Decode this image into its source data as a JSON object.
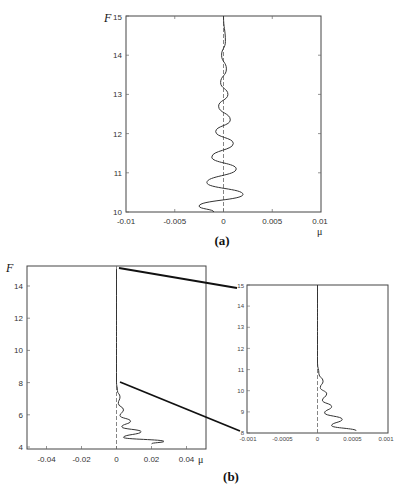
{
  "chart_data": [
    {
      "id": "a",
      "type": "line",
      "panel_label": "(a)",
      "title": "",
      "xlabel": "μ",
      "ylabel": "F",
      "xlim": [
        -0.01,
        0.01
      ],
      "ylim": [
        10,
        15
      ],
      "xticks": [
        -0.01,
        -0.005,
        0,
        0.005,
        0.01
      ],
      "xtick_labels": [
        "-0.01",
        "-0.005",
        "0",
        "0.005",
        "0.01"
      ],
      "yticks": [
        10,
        11,
        12,
        13,
        14,
        15
      ],
      "ytick_labels": [
        "10",
        "11",
        "12",
        "13",
        "14",
        "15"
      ],
      "grid": false,
      "zero_line": "dashed vertical at μ=0",
      "series": [
        {
          "name": "μ(F)",
          "description": "damped oscillation about μ=0, amplitude decaying with increasing F",
          "x": [
            -0.001,
            -0.0025,
            0.002,
            -0.0017,
            0.0013,
            -0.0012,
            0.001,
            -0.0008,
            0.0007,
            -0.0005,
            0.00045,
            -0.0003,
            0.0003,
            -0.0002,
            0.0002,
            0
          ],
          "y": [
            10.0,
            10.15,
            10.45,
            10.75,
            11.1,
            11.4,
            11.75,
            12.05,
            12.35,
            12.7,
            13.0,
            13.3,
            13.65,
            14.0,
            14.35,
            15.0
          ]
        }
      ]
    },
    {
      "id": "b-main",
      "type": "line",
      "panel_label": "(b)",
      "title": "",
      "xlabel": "μ",
      "ylabel": "F",
      "xlim": [
        -0.051,
        0.051
      ],
      "ylim": [
        3.88,
        15.2
      ],
      "xticks": [
        -0.04,
        -0.02,
        0,
        0.02,
        0.04
      ],
      "xtick_labels": [
        "-0.04",
        "-0.02",
        "0",
        "0.02",
        "0.04"
      ],
      "yticks": [
        4,
        6,
        8,
        10,
        12,
        14
      ],
      "ytick_labels": [
        "4",
        "6",
        "8",
        "10",
        "12",
        "14"
      ],
      "grid": false,
      "zero_line": "dashed vertical at μ=0",
      "series": [
        {
          "name": "μ(F)",
          "description": "one-sided decaying oscillation for μ≥0, large near F≈4, near zero above F≈8",
          "x": [
            0.02,
            0.027,
            0.004,
            0.014,
            0.003,
            0.008,
            0.002,
            0.004,
            0.001,
            0.002,
            0.0005,
            0,
            0
          ],
          "y": [
            4.2,
            4.35,
            4.6,
            4.95,
            5.25,
            5.6,
            5.95,
            6.3,
            6.7,
            7.1,
            7.5,
            8.0,
            15.0
          ]
        }
      ]
    },
    {
      "id": "b-inset",
      "type": "line",
      "panel_label": "",
      "title": "",
      "xlabel": "",
      "ylabel": "",
      "xlim": [
        -0.001,
        0.001
      ],
      "ylim": [
        8,
        15
      ],
      "xticks": [
        -0.001,
        -0.0005,
        0,
        0.0005,
        0.001
      ],
      "xtick_labels": [
        "-0.001",
        "-0.0005",
        "0",
        "0.0005",
        "0.001"
      ],
      "yticks": [
        8,
        9,
        10,
        11,
        12,
        13,
        14,
        15
      ],
      "ytick_labels": [
        "8",
        "9",
        "10",
        "11",
        "12",
        "13",
        "14",
        "15"
      ],
      "grid": false,
      "zero_line": "dashed vertical at μ=0",
      "series": [
        {
          "name": "μ(F) zoomed",
          "description": "magnified view of panel (b) for F in [8,15]",
          "x": [
            0.00055,
            0.0002,
            0.00035,
            0.0001,
            0.0002,
            7e-05,
            0.00013,
            4e-05,
            8e-05,
            2e-05,
            0,
            0
          ],
          "y": [
            8.1,
            8.35,
            8.65,
            8.95,
            9.25,
            9.55,
            9.85,
            10.15,
            10.45,
            10.8,
            11.3,
            15.0
          ]
        }
      ],
      "connectors": [
        {
          "from": "b-main F=15 at μ=0",
          "to": "inset top-left (F=15)"
        },
        {
          "from": "b-main F=8 at μ=0",
          "to": "inset bottom-left (F=8)"
        }
      ]
    }
  ],
  "labels": {
    "a": {
      "panel": "(a)",
      "F": "F",
      "mu": "μ",
      "xticks": [
        "-0.01",
        "-0.005",
        "0",
        "0.005",
        "0.01"
      ],
      "yticks": [
        "10",
        "11",
        "12",
        "13",
        "14",
        "15"
      ]
    },
    "b": {
      "panel": "(b)",
      "F": "F",
      "mu": "μ",
      "xticks": [
        "-0.04",
        "-0.02",
        "0",
        "0.02",
        "0.04"
      ],
      "yticks": [
        "4",
        "6",
        "8",
        "10",
        "12",
        "14"
      ]
    },
    "inset": {
      "xticks": [
        "-0.001",
        "-0.0005",
        "0",
        "0.0005",
        "0.001"
      ],
      "yticks": [
        "8",
        "9",
        "10",
        "11",
        "12",
        "13",
        "14",
        "15"
      ]
    }
  },
  "colors": {
    "ink": "#333333",
    "frame": "#444444",
    "background": "#ffffff"
  }
}
